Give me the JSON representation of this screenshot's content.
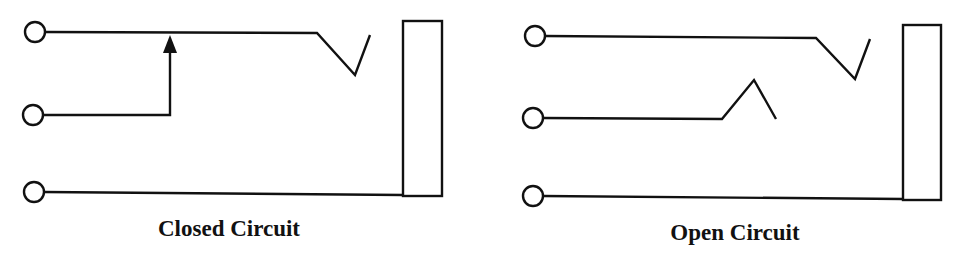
{
  "diagrams": [
    {
      "id": "closed",
      "caption": "Closed Circuit",
      "state": "closed",
      "terminals": [
        "tip",
        "switch",
        "sleeve"
      ]
    },
    {
      "id": "open",
      "caption": "Open Circuit",
      "state": "open",
      "terminals": [
        "tip",
        "switch",
        "sleeve"
      ]
    }
  ],
  "colors": {
    "line": "#111111",
    "background": "#ffffff"
  }
}
